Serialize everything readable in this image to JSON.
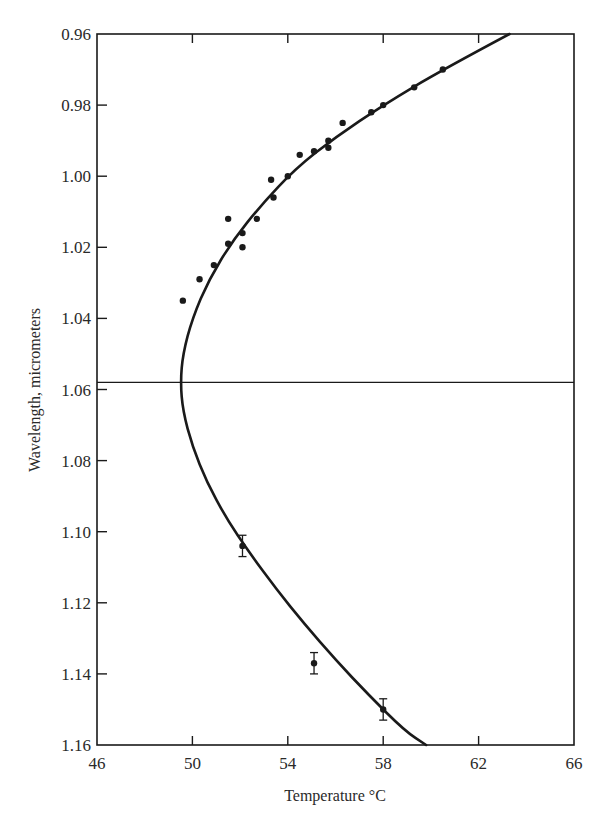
{
  "chart_data": {
    "type": "scatter",
    "title": "",
    "xlabel": "Temperature °C",
    "ylabel": "Wavelength, micrometers",
    "xlim": [
      46,
      66
    ],
    "ylim": [
      0.96,
      1.16
    ],
    "y_inverted": true,
    "grid": false,
    "x_ticks": [
      46,
      50,
      54,
      58,
      62,
      66
    ],
    "x_tick_labels": [
      "46",
      "50",
      "54",
      "58",
      "62",
      "66"
    ],
    "y_ticks": [
      0.96,
      0.98,
      1.0,
      1.02,
      1.04,
      1.06,
      1.08,
      1.1,
      1.12,
      1.14,
      1.16
    ],
    "y_tick_labels": [
      "0.96",
      "0.98",
      "1.00",
      "1.02",
      "1.04",
      "1.06",
      "1.08",
      "1.10",
      "1.12",
      "1.14",
      "1.16"
    ],
    "reference_line": {
      "orientation": "horizontal",
      "y": 1.058
    },
    "fit_curve": {
      "description": "Parabolic fit with vertex near (49.5, 1.058)",
      "points": [
        [
          63.3,
          0.96
        ],
        [
          60.5,
          0.97
        ],
        [
          58.0,
          0.98
        ],
        [
          56.0,
          0.989
        ],
        [
          54.3,
          0.998
        ],
        [
          52.9,
          1.008
        ],
        [
          51.7,
          1.018
        ],
        [
          50.7,
          1.029
        ],
        [
          50.0,
          1.04
        ],
        [
          49.6,
          1.05
        ],
        [
          49.5,
          1.058
        ],
        [
          49.6,
          1.066
        ],
        [
          50.0,
          1.076
        ],
        [
          50.6,
          1.086
        ],
        [
          51.4,
          1.096
        ],
        [
          52.4,
          1.106
        ],
        [
          53.5,
          1.116
        ],
        [
          54.7,
          1.126
        ],
        [
          56.0,
          1.136
        ],
        [
          57.4,
          1.146
        ],
        [
          58.9,
          1.156
        ],
        [
          59.8,
          1.16
        ]
      ]
    },
    "series": [
      {
        "name": "measured points (upper branch)",
        "marker": "dot",
        "points": [
          [
            49.6,
            1.035
          ],
          [
            50.3,
            1.029
          ],
          [
            50.9,
            1.025
          ],
          [
            51.5,
            1.012
          ],
          [
            51.5,
            1.019
          ],
          [
            52.1,
            1.016
          ],
          [
            52.1,
            1.02
          ],
          [
            52.7,
            1.012
          ],
          [
            53.3,
            1.001
          ],
          [
            53.4,
            1.006
          ],
          [
            54.0,
            1.0
          ],
          [
            54.5,
            0.994
          ],
          [
            55.1,
            0.993
          ],
          [
            55.7,
            0.992
          ],
          [
            55.7,
            0.99
          ],
          [
            56.3,
            0.985
          ],
          [
            57.5,
            0.982
          ],
          [
            58.0,
            0.98
          ],
          [
            59.3,
            0.975
          ],
          [
            60.5,
            0.97
          ]
        ]
      },
      {
        "name": "measured points with error bars (lower branch)",
        "marker": "dot-errorbar",
        "points": [
          {
            "x": 52.1,
            "y": 1.104,
            "err": 0.003
          },
          {
            "x": 55.1,
            "y": 1.137,
            "err": 0.003
          },
          {
            "x": 58.0,
            "y": 1.15,
            "err": 0.003
          }
        ]
      }
    ]
  },
  "colors": {
    "ink": "#1a1a1a",
    "background": "#ffffff"
  }
}
